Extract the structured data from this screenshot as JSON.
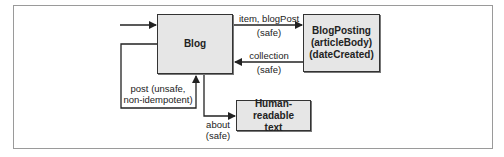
{
  "diagram": {
    "nodes": {
      "blog": {
        "label": "Blog"
      },
      "blogposting": {
        "lines": [
          "BlogPosting",
          "(articleBody)",
          "(dateCreated)"
        ]
      },
      "human_text": {
        "lines": [
          "Human-readable",
          "text"
        ]
      }
    },
    "edges": {
      "item": {
        "line1": "item, blogPost",
        "line2": "(safe)"
      },
      "collection": {
        "line1": "collection",
        "line2": "(safe)"
      },
      "post": {
        "line1": "post (unsafe,",
        "line2": "non-idempotent)"
      },
      "about": {
        "line1": "about",
        "line2": "(safe)"
      }
    },
    "colors": {
      "node_fill": "#e6e6e6",
      "node_border": "#333333",
      "edge": "#222222",
      "frame": "#9a9a9a"
    }
  }
}
